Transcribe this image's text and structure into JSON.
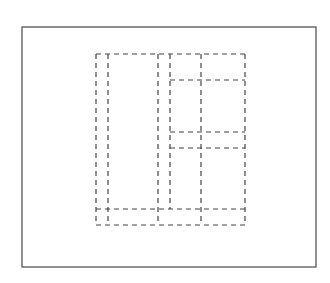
{
  "diagram": {
    "title": "",
    "colors": {
      "frame": "#555555",
      "dash": "#444444",
      "background": "#ffffff"
    },
    "outer_frame": {
      "x": 22,
      "y": 27,
      "width": 294,
      "height": 240
    },
    "dashed_lines": [
      {
        "id": "v1",
        "x1": 96,
        "y1": 54,
        "x2": 96,
        "y2": 225
      },
      {
        "id": "v2",
        "x1": 108,
        "y1": 54,
        "x2": 108,
        "y2": 225
      },
      {
        "id": "v3",
        "x1": 158,
        "y1": 54,
        "x2": 158,
        "y2": 225
      },
      {
        "id": "v4",
        "x1": 170,
        "y1": 54,
        "x2": 170,
        "y2": 209
      },
      {
        "id": "v5",
        "x1": 201,
        "y1": 54,
        "x2": 201,
        "y2": 225
      },
      {
        "id": "v6",
        "x1": 245,
        "y1": 54,
        "x2": 245,
        "y2": 225
      },
      {
        "id": "h-top",
        "x1": 96,
        "y1": 54,
        "x2": 245,
        "y2": 54
      },
      {
        "id": "h-80",
        "x1": 170,
        "y1": 80,
        "x2": 245,
        "y2": 80
      },
      {
        "id": "h-132",
        "x1": 170,
        "y1": 132,
        "x2": 245,
        "y2": 132
      },
      {
        "id": "h-148",
        "x1": 170,
        "y1": 148,
        "x2": 245,
        "y2": 148
      },
      {
        "id": "h-209",
        "x1": 96,
        "y1": 209,
        "x2": 245,
        "y2": 209
      },
      {
        "id": "h-bottom",
        "x1": 96,
        "y1": 225,
        "x2": 245,
        "y2": 225
      }
    ]
  }
}
